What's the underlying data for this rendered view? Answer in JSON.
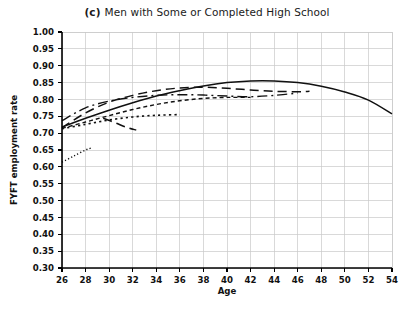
{
  "title": {
    "panel_letter": "(c)",
    "text": "Men with Some or Completed High School"
  },
  "axes": {
    "xlabel": "Age",
    "ylabel": "FYFT employment rate",
    "xticks": [
      "26",
      "28",
      "30",
      "32",
      "34",
      "36",
      "38",
      "40",
      "42",
      "44",
      "46",
      "48",
      "50",
      "52",
      "54"
    ],
    "yticks": [
      "1.00",
      "0.95",
      "0.90",
      "0.85",
      "0.80",
      "0.75",
      "0.70",
      "0.65",
      "0.60",
      "0.55",
      "0.50",
      "0.45",
      "0.40",
      "0.35",
      "0.30"
    ]
  },
  "chart_data": {
    "type": "line",
    "xlabel": "Age",
    "ylabel": "FYFT employment rate",
    "xlim": [
      26,
      54
    ],
    "ylim": [
      0.3,
      1.0
    ],
    "xticks": [
      26,
      28,
      30,
      32,
      34,
      36,
      38,
      40,
      42,
      44,
      46,
      48,
      50,
      52,
      54
    ],
    "yticks": [
      0.3,
      0.35,
      0.4,
      0.45,
      0.5,
      0.55,
      0.6,
      0.65,
      0.7,
      0.75,
      0.8,
      0.85,
      0.9,
      0.95,
      1.0
    ],
    "grid": true,
    "legend": "none",
    "line_color": "#111111",
    "series": [
      {
        "name": "cohort-solid",
        "style": "solid",
        "x": [
          26,
          28,
          30,
          32,
          34,
          36,
          38,
          40,
          42,
          44,
          46,
          48,
          50,
          52,
          54
        ],
        "y": [
          0.718,
          0.744,
          0.768,
          0.79,
          0.81,
          0.826,
          0.84,
          0.85,
          0.855,
          0.855,
          0.85,
          0.839,
          0.822,
          0.798,
          0.757
        ]
      },
      {
        "name": "cohort-long-dash",
        "style": "long-dash",
        "x": [
          26,
          28,
          30,
          32,
          34,
          36,
          38,
          40,
          42,
          44,
          46,
          47
        ],
        "y": [
          0.716,
          0.76,
          0.792,
          0.812,
          0.826,
          0.834,
          0.836,
          0.833,
          0.828,
          0.824,
          0.823,
          0.824
        ]
      },
      {
        "name": "cohort-dash-dot",
        "style": "dash-dot",
        "x": [
          26,
          28,
          30,
          32,
          34,
          36,
          38,
          40,
          42,
          44,
          46
        ],
        "y": [
          0.737,
          0.775,
          0.795,
          0.806,
          0.812,
          0.814,
          0.813,
          0.81,
          0.808,
          0.812,
          0.819
        ]
      },
      {
        "name": "cohort-short-dash",
        "style": "short-dash",
        "x": [
          26,
          28,
          30,
          32,
          34,
          36,
          38,
          40,
          42
        ],
        "y": [
          0.714,
          0.733,
          0.752,
          0.77,
          0.785,
          0.796,
          0.803,
          0.806,
          0.806
        ]
      },
      {
        "name": "cohort-medium-dot",
        "style": "medium-dot",
        "x": [
          26,
          28,
          30,
          32,
          34,
          36
        ],
        "y": [
          0.713,
          0.726,
          0.739,
          0.748,
          0.753,
          0.755
        ]
      },
      {
        "name": "cohort-descending-dash",
        "style": "long-dash",
        "x": [
          29.5,
          30.5,
          31.5,
          32.3
        ],
        "y": [
          0.744,
          0.731,
          0.717,
          0.709
        ]
      },
      {
        "name": "cohort-fine-dot",
        "style": "fine-dot",
        "x": [
          26,
          27,
          28,
          28.6
        ],
        "y": [
          0.614,
          0.632,
          0.65,
          0.657
        ]
      }
    ]
  }
}
